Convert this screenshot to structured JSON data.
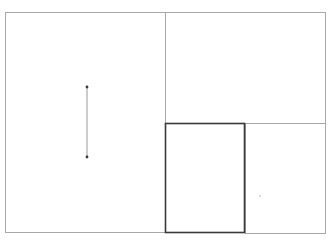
{
  "diagram": {
    "type": "layout-wireframe",
    "background": "#ffffff",
    "line_color": "#a8a8a8",
    "highlight_color": "#3a3a3a",
    "outer_frame": {
      "x": 5,
      "y": 12,
      "w": 321,
      "h": 221
    },
    "panels": [
      {
        "id": "left-panel",
        "x": 5,
        "y": 12,
        "w": 160,
        "h": 221
      },
      {
        "id": "top-right-panel",
        "x": 165,
        "y": 12,
        "w": 161,
        "h": 111
      },
      {
        "id": "bottom-middle-panel",
        "x": 165,
        "y": 123,
        "w": 80,
        "h": 110,
        "selected": true
      },
      {
        "id": "bottom-right-panel",
        "x": 245,
        "y": 123,
        "w": 81,
        "h": 110
      }
    ],
    "vertical_dimension_line": {
      "x": 87,
      "y1": 87,
      "y2": 157
    },
    "marker_dot": {
      "x": 260,
      "y": 196
    }
  }
}
